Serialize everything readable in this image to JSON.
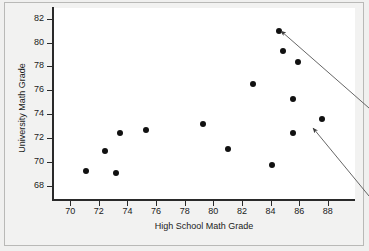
{
  "figure": {
    "background_color": "#f0f0ef",
    "panel_color": "#f2f2f1",
    "plot_area_color": "#ffffff",
    "axis_color": "#2a2a2a",
    "point_color": "#111111",
    "annotation_color": "#555555"
  },
  "chart_data": {
    "type": "scatter",
    "title": "",
    "xlabel": "High School Math Grade",
    "ylabel": "University Math Grade",
    "xlim": [
      68.8,
      89.9
    ],
    "ylim": [
      66.8,
      82.9
    ],
    "xticks": [
      70,
      72,
      74,
      76,
      78,
      80,
      82,
      84,
      86,
      88
    ],
    "xtick_labels": [
      "70",
      "72",
      "74",
      "76",
      "78",
      "80",
      "82",
      "84",
      "86",
      "88"
    ],
    "yticks": [
      68,
      70,
      72,
      74,
      76,
      78,
      80,
      82
    ],
    "ytick_labels": [
      "68",
      "70",
      "72",
      "74",
      "76",
      "78",
      "80",
      "82"
    ],
    "grid": false,
    "legend": null,
    "marker": "filled-circle",
    "x": [
      71.1,
      72.4,
      73.2,
      73.5,
      75.3,
      79.3,
      81.0,
      82.8,
      84.1,
      84.6,
      84.9,
      85.6,
      85.6,
      85.9,
      87.6
    ],
    "y": [
      69.2,
      70.9,
      69.1,
      72.4,
      72.7,
      73.2,
      71.1,
      76.5,
      69.7,
      81.0,
      79.3,
      72.4,
      75.3,
      78.4,
      73.6
    ],
    "points": [
      {
        "x": 71.1,
        "y": 69.2
      },
      {
        "x": 72.4,
        "y": 70.9
      },
      {
        "x": 73.2,
        "y": 69.1
      },
      {
        "x": 73.5,
        "y": 72.4
      },
      {
        "x": 75.3,
        "y": 72.7
      },
      {
        "x": 79.3,
        "y": 73.2
      },
      {
        "x": 81.0,
        "y": 71.1
      },
      {
        "x": 82.8,
        "y": 76.5
      },
      {
        "x": 84.1,
        "y": 69.7
      },
      {
        "x": 84.6,
        "y": 81.0
      },
      {
        "x": 84.9,
        "y": 79.3
      },
      {
        "x": 85.6,
        "y": 72.4
      },
      {
        "x": 85.6,
        "y": 75.3
      },
      {
        "x": 85.9,
        "y": 78.4
      },
      {
        "x": 87.6,
        "y": 73.6
      }
    ],
    "annotations": [
      {
        "name": "arrow-to-high-outlier",
        "type": "arrow",
        "label": "",
        "points_to": {
          "x": 84.6,
          "y": 81.0
        },
        "tail_px": {
          "x": 369,
          "y": 108
        },
        "head_px": {
          "x": 281,
          "y": 31
        }
      },
      {
        "name": "arrow-to-right-outlier",
        "type": "arrow",
        "label": "",
        "points_to": {
          "x": 87.6,
          "y": 73.6
        },
        "tail_px": {
          "x": 369,
          "y": 196
        },
        "head_px": {
          "x": 313,
          "y": 128
        }
      }
    ]
  }
}
